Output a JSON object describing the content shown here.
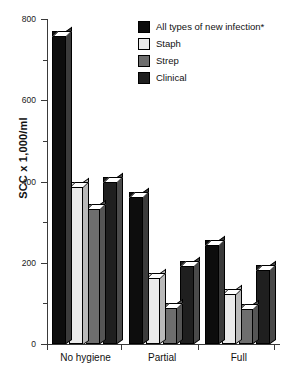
{
  "chart_data": {
    "type": "bar",
    "title": "",
    "xlabel": "",
    "ylabel": "SCC x 1,000/ml",
    "categories": [
      "No hygiene",
      "Partial",
      "Full"
    ],
    "series": [
      {
        "name": "All types of new infection*",
        "color": "#0d0d0d",
        "values": [
          770,
          375,
          255
        ]
      },
      {
        "name": "Staph",
        "color": "#ebebeb",
        "values": [
          400,
          175,
          135
        ]
      },
      {
        "name": "Strep",
        "color": "#6e6e6e",
        "values": [
          345,
          100,
          98
        ]
      },
      {
        "name": "Clinical",
        "color": "#1f1f1f",
        "values": [
          410,
          205,
          195
        ]
      }
    ],
    "ylim": [
      0,
      800
    ],
    "y_ticks": [
      0,
      200,
      400,
      600,
      800
    ],
    "y_tick_labels": [
      "0",
      "200",
      "400",
      "600",
      "800"
    ],
    "y_minor_ticks": [
      100,
      300,
      500,
      700
    ],
    "grid": false,
    "legend_position": "top-right"
  }
}
